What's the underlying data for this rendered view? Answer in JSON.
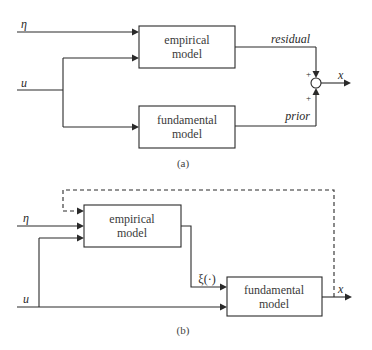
{
  "diagram_a": {
    "caption": "(a)",
    "inputs": {
      "eta": "η",
      "u": "u"
    },
    "empirical_box": {
      "line1": "empirical",
      "line2": "model"
    },
    "fundamental_box": {
      "line1": "fundamental",
      "line2": "model"
    },
    "residual_label": "residual",
    "prior_label": "prior",
    "sum_signs": {
      "top": "+",
      "bottom": "+"
    },
    "output": "x"
  },
  "diagram_b": {
    "caption": "(b)",
    "inputs": {
      "eta": "η",
      "u": "u"
    },
    "empirical_box": {
      "line1": "empirical",
      "line2": "model"
    },
    "fundamental_box": {
      "line1": "fundamental",
      "line2": "model"
    },
    "xi_label": "ξ(·)",
    "output": "x",
    "feedback": "dashed"
  }
}
